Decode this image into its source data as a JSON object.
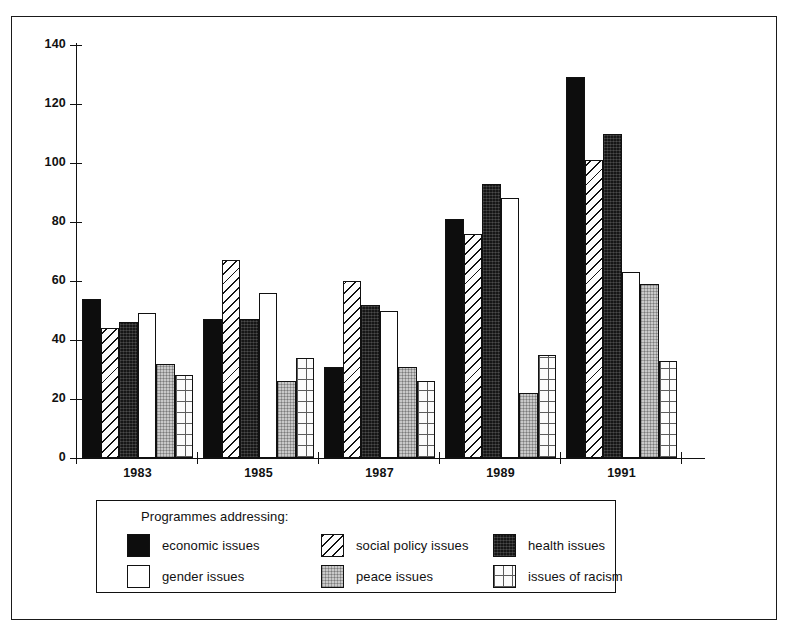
{
  "chart_data": {
    "type": "bar",
    "title": "",
    "subtitle": "",
    "xlabel": "",
    "ylabel": "",
    "ylim": [
      0,
      140
    ],
    "y_ticks": [
      0,
      20,
      40,
      60,
      80,
      100,
      120,
      140
    ],
    "grid": false,
    "legend_position": "below-plot",
    "legend_title": "Programmes addressing:",
    "categories": [
      "1983",
      "1985",
      "1987",
      "1989",
      "1991"
    ],
    "series": [
      {
        "name": "economic issues",
        "pattern": "solid-black",
        "values": [
          54,
          47,
          31,
          81,
          129
        ]
      },
      {
        "name": "social policy issues",
        "pattern": "diagonal",
        "values": [
          44,
          67,
          60,
          76,
          101
        ]
      },
      {
        "name": "health issues",
        "pattern": "dark-texture",
        "values": [
          46,
          47,
          52,
          93,
          110
        ]
      },
      {
        "name": "gender issues",
        "pattern": "white",
        "values": [
          49,
          56,
          50,
          88,
          63
        ]
      },
      {
        "name": "peace issues",
        "pattern": "gray-dot",
        "values": [
          32,
          26,
          31,
          22,
          59
        ]
      },
      {
        "name": "issues of racism",
        "pattern": "grid",
        "values": [
          28,
          34,
          26,
          35,
          33
        ]
      }
    ]
  },
  "axis": {
    "y_tick_labels": [
      "140",
      "120",
      "100",
      "80",
      "60",
      "40",
      "20",
      "0"
    ],
    "x_tick_labels": [
      "1983",
      "1985",
      "1987",
      "1989",
      "1991"
    ]
  },
  "legend": {
    "title": "Programmes addressing:",
    "entries": [
      {
        "label": "economic issues",
        "pattern": "solid-black"
      },
      {
        "label": "social policy issues",
        "pattern": "diagonal"
      },
      {
        "label": "health issues",
        "pattern": "dark-texture"
      },
      {
        "label": "gender issues",
        "pattern": "white"
      },
      {
        "label": "peace issues",
        "pattern": "gray-dot"
      },
      {
        "label": "issues of racism",
        "pattern": "grid"
      }
    ]
  },
  "colors": {
    "ink": "#111111",
    "solid_black": "#0d0d0d",
    "dark_texture": "#161616",
    "gray_dot": "#c9c9c9",
    "white": "#ffffff",
    "paper": "#ffffff"
  }
}
